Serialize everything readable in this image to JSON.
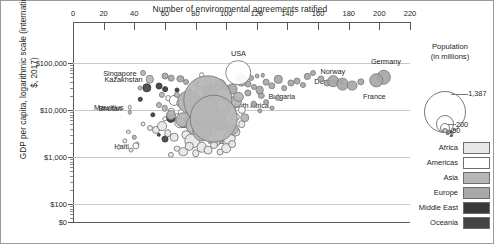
{
  "chart_data": {
    "type": "scatter",
    "title": "",
    "xlabel": "Number of environmental agreements ratified",
    "ylabel": "GDP per capita, logarithmic scale (international $, 2017)",
    "xlim": [
      0,
      220
    ],
    "xticks": [
      0,
      20,
      40,
      60,
      80,
      100,
      120,
      140,
      160,
      180,
      200,
      220
    ],
    "yticks": [
      "$0",
      "$100",
      "$1,000",
      "$10,000",
      "$100,000"
    ],
    "yscale": "log",
    "grid": true,
    "bubble_size_encodes": "population",
    "color_encodes": "region",
    "labeled_points": [
      {
        "name": "Singapore",
        "x": 46,
        "y": 62000,
        "population": 5,
        "region": "Asia",
        "label_side": "right"
      },
      {
        "name": "Kazakhstan",
        "x": 50,
        "y": 45000,
        "population": 18,
        "region": "Asia",
        "label_side": "right"
      },
      {
        "name": "China",
        "x": 88,
        "y": 16000,
        "population": 1387,
        "region": "Asia",
        "label_side": "center"
      },
      {
        "name": "Mauritius",
        "x": 37,
        "y": 11500,
        "population": 1,
        "region": "Africa",
        "label_side": "right"
      },
      {
        "name": "USA",
        "x": 108,
        "y": 62000,
        "population": 325,
        "region": "Americas",
        "label_side": "center"
      },
      {
        "name": "Norway",
        "x": 157,
        "y": 60000,
        "population": 5,
        "region": "Europe",
        "label_side": "left"
      },
      {
        "name": "Denmark",
        "x": 153,
        "y": 52000,
        "population": 6,
        "region": "Europe",
        "label_side": "left"
      },
      {
        "name": "Germany",
        "x": 203,
        "y": 50000,
        "population": 83,
        "region": "Europe",
        "label_side": "center"
      },
      {
        "name": "France",
        "x": 198,
        "y": 43000,
        "population": 67,
        "region": "Europe",
        "label_side": "center"
      },
      {
        "name": "Bulgaria",
        "x": 123,
        "y": 20000,
        "population": 7,
        "region": "Europe",
        "label_side": "left"
      },
      {
        "name": "South Africa",
        "x": 97,
        "y": 12500,
        "population": 57,
        "region": "Africa",
        "label_side": "left"
      },
      {
        "name": "Bhutan",
        "x": 37,
        "y": 9000,
        "population": 1,
        "region": "Asia",
        "label_side": "right"
      },
      {
        "name": "Haiti",
        "x": 41,
        "y": 1750,
        "population": 11,
        "region": "Americas",
        "label_side": "right"
      },
      {
        "name": "India",
        "x": 92,
        "y": 6500,
        "population": 1339,
        "region": "Asia",
        "label_side": "center"
      }
    ]
  },
  "population_legend": {
    "title_line1": "Population",
    "title_line2": "(in millions)",
    "values": [
      "1,387",
      "200",
      "50",
      "5",
      "1"
    ]
  },
  "region_legend": {
    "items": [
      {
        "label": "Africa",
        "color": "#e8e8e8"
      },
      {
        "label": "Americas",
        "color": "#ffffff"
      },
      {
        "label": "Asia",
        "color": "#b6b6b6"
      },
      {
        "label": "Europe",
        "color": "#a8a8a8"
      },
      {
        "label": "Middle East",
        "color": "#3a3a3a"
      },
      {
        "label": "Oceania",
        "color": "#444444"
      }
    ]
  }
}
